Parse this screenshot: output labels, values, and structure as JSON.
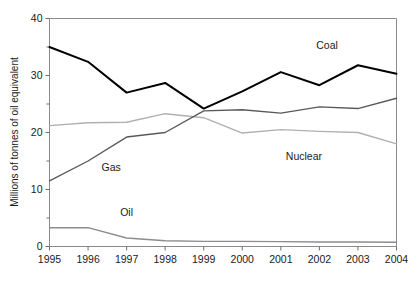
{
  "chart_data": {
    "type": "line",
    "title": "",
    "xlabel": "",
    "ylabel": "Millions of tonnes of oil equivalent",
    "x": [
      1995,
      1996,
      1997,
      1998,
      1999,
      2000,
      2001,
      2002,
      2003,
      2004
    ],
    "xtick_labels": [
      "1995",
      "1996",
      "1997",
      "1998",
      "1999",
      "2000",
      "2001",
      "2002",
      "2003",
      "2004"
    ],
    "ytick_labels": [
      "0",
      "10",
      "20",
      "30",
      "40"
    ],
    "ytick_values": [
      0,
      10,
      20,
      30,
      40
    ],
    "yminor_values": [
      5,
      15,
      25,
      35
    ],
    "ylim": [
      0,
      40
    ],
    "xlim": [
      1995,
      2004
    ],
    "grid": false,
    "legend_position": "inline-labels",
    "series": [
      {
        "name": "Coal",
        "color": "#000000",
        "width": 2.0,
        "values": [
          35.0,
          32.4,
          27.0,
          28.7,
          24.2,
          27.2,
          30.6,
          28.3,
          31.8,
          30.3
        ],
        "label_x": 2002.2,
        "label_y": 34.6
      },
      {
        "name": "Gas",
        "color": "#5a5a5a",
        "width": 1.4,
        "values": [
          11.5,
          15.0,
          19.2,
          20.0,
          23.8,
          24.0,
          23.4,
          24.5,
          24.2,
          26.0
        ],
        "label_x": 1996.6,
        "label_y": 13.2
      },
      {
        "name": "Nuclear",
        "color": "#b0b0b0",
        "width": 1.4,
        "values": [
          21.2,
          21.7,
          21.8,
          23.3,
          22.6,
          19.9,
          20.5,
          20.2,
          20.0,
          18.0
        ],
        "label_x": 2001.6,
        "label_y": 15.2
      },
      {
        "name": "Oil",
        "color": "#8c8c8c",
        "width": 1.4,
        "values": [
          3.3,
          3.3,
          1.5,
          1.0,
          0.9,
          0.9,
          0.85,
          0.8,
          0.8,
          0.75
        ],
        "label_x": 1997.0,
        "label_y": 5.3
      }
    ]
  },
  "axes": {
    "y_axis_title": "Millions of tonnes of oil equivalent"
  }
}
